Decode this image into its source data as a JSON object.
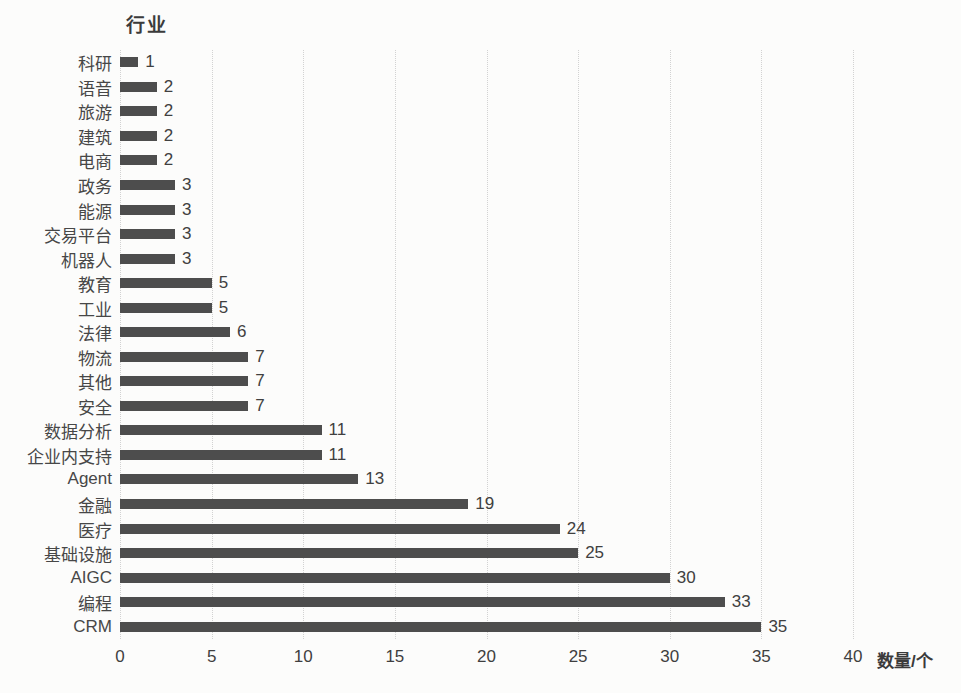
{
  "chart_data": {
    "type": "bar",
    "orientation": "horizontal",
    "title": "行业",
    "xlabel": "数量/个",
    "ylabel": "",
    "categories": [
      "科研",
      "语音",
      "旅游",
      "建筑",
      "电商",
      "政务",
      "能源",
      "交易平台",
      "机器人",
      "教育",
      "工业",
      "法律",
      "物流",
      "其他",
      "安全",
      "数据分析",
      "企业内支持",
      "Agent",
      "金融",
      "医疗",
      "基础设施",
      "AIGC",
      "编程",
      "CRM"
    ],
    "values": [
      1,
      2,
      2,
      2,
      2,
      3,
      3,
      3,
      3,
      5,
      5,
      6,
      7,
      7,
      7,
      11,
      11,
      13,
      19,
      24,
      25,
      30,
      33,
      35
    ],
    "xlim": [
      0,
      40
    ],
    "xticks": [
      0,
      5,
      10,
      15,
      20,
      25,
      30,
      35,
      40
    ],
    "grid": "vertical-dotted",
    "legend": "none",
    "colors": {
      "bar": "#4d4d4d",
      "text": "#404040",
      "grid": "#d2d2d2",
      "background": "#fcfcfb"
    }
  }
}
